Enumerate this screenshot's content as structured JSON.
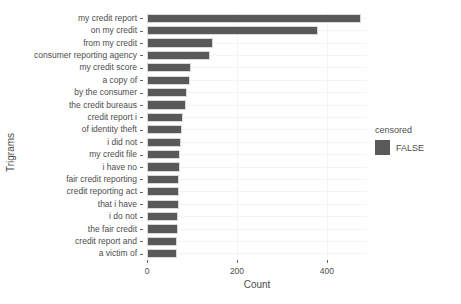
{
  "chart_data": {
    "type": "bar",
    "orientation": "horizontal",
    "title": "",
    "xlabel": "Count",
    "ylabel": "Trigrams",
    "xlim": [
      0,
      489
    ],
    "xticks": [
      0,
      200,
      400
    ],
    "xtick_labels": [
      "0",
      "200",
      "400"
    ],
    "grid": true,
    "legend": {
      "title": "censored",
      "position": "right",
      "entries": [
        {
          "label": "FALSE",
          "color": "#595959"
        }
      ]
    },
    "series": [
      {
        "name": "FALSE",
        "color": "#595959",
        "categories": [
          "my credit report",
          "on my credit",
          "from my credit",
          "consumer reporting agency",
          "my credit score",
          "a copy of",
          "by the consumer",
          "the credit bureaus",
          "credit report i",
          "of identity theft",
          "i did not",
          "my credit file",
          "i have no",
          "fair credit reporting",
          "credit reporting act",
          "that i have",
          "i do not",
          "the fair credit",
          "credit report and",
          "a victim of"
        ],
        "values": [
          475,
          380,
          147,
          140,
          98,
          95,
          88,
          86,
          80,
          78,
          76,
          74,
          73,
          72,
          72,
          71,
          70,
          70,
          67,
          66
        ]
      }
    ]
  },
  "legend": {
    "title": "censored",
    "entries": [
      {
        "label": "FALSE"
      }
    ]
  },
  "axes": {
    "x_title": "Count",
    "y_title": "Trigrams"
  },
  "colors": {
    "bar": "#595959",
    "panel_background": "#ffffff",
    "gridline": "#f4f4f4",
    "text": "#4d4d4d"
  }
}
